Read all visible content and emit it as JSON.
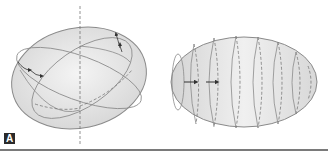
{
  "figure": {
    "panels": [
      {
        "id": "A",
        "label": "A",
        "description": "Ellipsoid with vertical dashed axis, tilted great circles and rotation arrows"
      },
      {
        "id": "B",
        "label": "B",
        "description": "Elongated ellipsoid with series of parallel elliptical sections and arrows indicating direction"
      }
    ]
  },
  "colors": {
    "fill": "#e4e4e4",
    "stroke": "#8a8a8a",
    "dashed": "#777777",
    "arrow": "#333333",
    "label_bg": "#2a2a2a",
    "rule": "#7a7a7a"
  }
}
